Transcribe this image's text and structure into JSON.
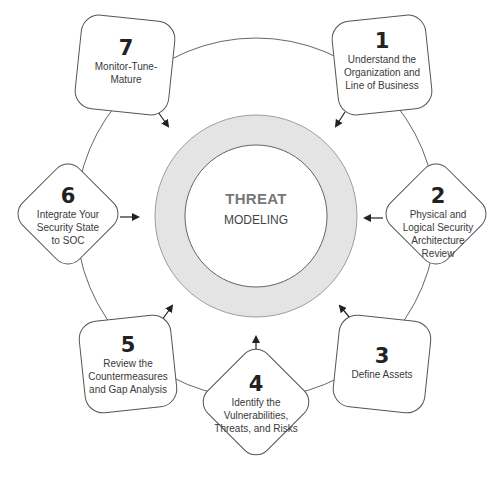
{
  "center": {
    "title": "THREAT",
    "subtitle": "MODELING"
  },
  "steps": [
    {
      "number": "1",
      "label_lines": [
        "Understand the",
        "Organization and",
        "Line of Business"
      ]
    },
    {
      "number": "2",
      "label_lines": [
        "Physical and",
        "Logical Security",
        "Architecture",
        "Review"
      ]
    },
    {
      "number": "3",
      "label_lines": [
        "Define Assets"
      ]
    },
    {
      "number": "4",
      "label_lines": [
        "Identify the",
        "Vulnerabilities,",
        "Threats, and Risks"
      ]
    },
    {
      "number": "5",
      "label_lines": [
        "Review the",
        "Countermeasures",
        "and Gap Analysis"
      ]
    },
    {
      "number": "6",
      "label_lines": [
        "Integrate Your",
        "Security State",
        "to SOC"
      ]
    },
    {
      "number": "7",
      "label_lines": [
        "Monitor-Tune-",
        "Mature"
      ]
    }
  ],
  "colors": {
    "ring_fill": "#e4e4e4",
    "stroke": "#555555",
    "arrow": "#222222"
  }
}
